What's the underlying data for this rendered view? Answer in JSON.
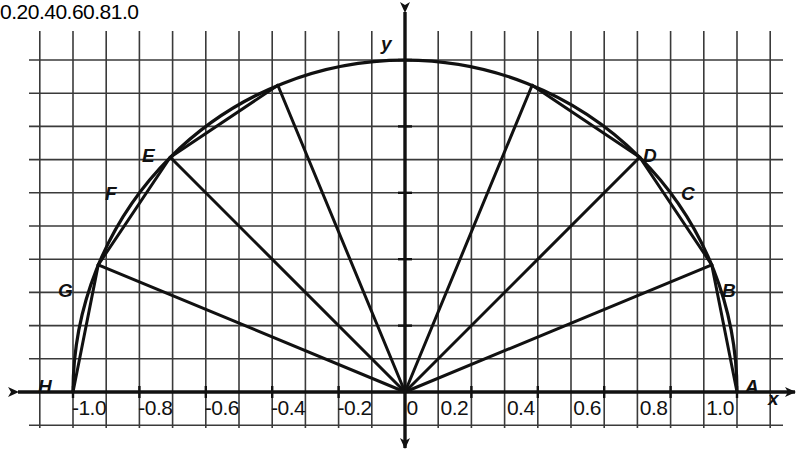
{
  "figure": {
    "type": "math-graph",
    "background_color": "#ffffff",
    "ink_color": "#111111",
    "grid_color": "#3a3a3a"
  },
  "axes": {
    "x_axis_label": "x",
    "y_axis_label": "y",
    "origin_label": "0",
    "x_ticks": [
      "-1.0",
      "-0.8",
      "-0.6",
      "-0.4",
      "-0.2",
      "0.2",
      "0.4",
      "0.6",
      "0.8",
      "1.0"
    ],
    "x_tick_values": [
      -1.0,
      -0.8,
      -0.6,
      -0.4,
      -0.2,
      0.2,
      0.4,
      0.6,
      0.8,
      1.0
    ],
    "y_ticks": [
      "0.2",
      "0.4",
      "0.6",
      "0.8",
      "1.0"
    ],
    "y_tick_values": [
      0.2,
      0.4,
      0.6,
      0.8,
      1.0
    ],
    "x_range": [
      -1.15,
      1.15
    ],
    "y_range": [
      -0.12,
      1.14
    ],
    "grid_step": 0.1,
    "grid_visible": true
  },
  "chart_data": {
    "type": "scatter",
    "title": "",
    "xlabel": "x",
    "ylabel": "y",
    "xlim": [
      -1.15,
      1.15
    ],
    "ylim": [
      -0.12,
      1.14
    ],
    "grid": true,
    "legend": "none",
    "curve": {
      "name": "unit semicircle",
      "equation": "x^2 + y^2 = 1, y >= 0",
      "radius": 1.0,
      "center": [
        0,
        0
      ]
    },
    "points": [
      {
        "label": "A",
        "x": 1.0,
        "y": 0.0,
        "angle_deg": 0
      },
      {
        "label": "B",
        "x": 0.924,
        "y": 0.383,
        "angle_deg": 22.5
      },
      {
        "label": "C",
        "x": 0.707,
        "y": 0.707,
        "angle_deg": 45
      },
      {
        "label": "D",
        "x": 0.383,
        "y": 0.924,
        "angle_deg": 67.5
      },
      {
        "label": "E",
        "x": -0.383,
        "y": 0.924,
        "angle_deg": 112.5
      },
      {
        "label": "F",
        "x": -0.707,
        "y": 0.707,
        "angle_deg": 135
      },
      {
        "label": "G",
        "x": -0.924,
        "y": 0.383,
        "angle_deg": 157.5
      },
      {
        "label": "H",
        "x": -1.0,
        "y": 0.0,
        "angle_deg": 180
      }
    ],
    "label_positions": [
      {
        "label": "A",
        "px": 745,
        "py": 376
      },
      {
        "label": "B",
        "px": 722,
        "py": 280
      },
      {
        "label": "C",
        "px": 681,
        "py": 183
      },
      {
        "label": "D",
        "px": 643,
        "py": 145
      },
      {
        "label": "E",
        "px": 142,
        "py": 145
      },
      {
        "label": "F",
        "px": 105,
        "py": 183
      },
      {
        "label": "G",
        "px": 58,
        "py": 280
      },
      {
        "label": "H",
        "px": 38,
        "py": 376
      }
    ],
    "radii": [
      {
        "from": "O",
        "to": "B"
      },
      {
        "from": "O",
        "to": "C"
      },
      {
        "from": "O",
        "to": "D"
      },
      {
        "from": "O",
        "to": "E"
      },
      {
        "from": "O",
        "to": "F"
      },
      {
        "from": "O",
        "to": "G"
      }
    ],
    "chords": [
      {
        "from": "A",
        "to": "B"
      },
      {
        "from": "B",
        "to": "C"
      },
      {
        "from": "C",
        "to": "D"
      },
      {
        "from": "E",
        "to": "F"
      },
      {
        "from": "F",
        "to": "G"
      },
      {
        "from": "G",
        "to": "H"
      }
    ]
  },
  "geometry": {
    "origin_px": {
      "x": 405,
      "y": 392
    },
    "unit_px": 332,
    "grid_cell_px": 33.2,
    "plot_left_px": 29,
    "plot_right_px": 783,
    "plot_top_px": 31,
    "plot_bottom_px": 428
  }
}
